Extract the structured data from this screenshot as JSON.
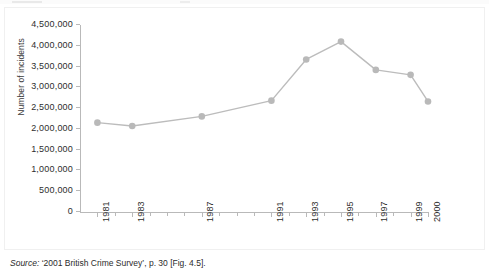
{
  "chart_data": {
    "type": "line",
    "title": "",
    "xlabel": "",
    "ylabel": "Number of incidents",
    "x": [
      1981,
      1983,
      1987,
      1991,
      1993,
      1995,
      1997,
      1999,
      2000
    ],
    "values": [
      2150000,
      2070000,
      2300000,
      2680000,
      3670000,
      4100000,
      3420000,
      3300000,
      2660000
    ],
    "series": [
      {
        "name": "Number of incidents",
        "values": [
          2150000,
          2070000,
          2300000,
          2680000,
          3670000,
          4100000,
          3420000,
          3300000,
          2660000
        ]
      }
    ],
    "categories": [
      "1981",
      "1983",
      "1987",
      "1991",
      "1993",
      "1995",
      "1997",
      "1999",
      "2000"
    ],
    "ylim": [
      0,
      4500000
    ],
    "xlim": [
      1980.5,
      2000.5
    ],
    "ytick_labels": [
      "0",
      "500,000",
      "1,000,000",
      "1,500,000",
      "2,000,000",
      "2,500,000",
      "3,000,000",
      "3,500,000",
      "4,000,000",
      "4,500,000"
    ],
    "ytick_values": [
      0,
      500000,
      1000000,
      1500000,
      2000000,
      2500000,
      3000000,
      3500000,
      4000000,
      4500000
    ],
    "xtick_years": [
      1981,
      1982,
      1983,
      1984,
      1985,
      1986,
      1987,
      1988,
      1989,
      1990,
      1991,
      1992,
      1993,
      1994,
      1995,
      1996,
      1997,
      1998,
      1999,
      2000
    ],
    "xtick_labelled": [
      "1981",
      "1983",
      "1987",
      "1991",
      "1993",
      "1995",
      "1997",
      "1999",
      "2000"
    ],
    "grid": false,
    "legend": "none",
    "line_color": "#bcbcbc",
    "marker_color": "#b9b9b9",
    "axis_color": "#b9b9b9",
    "marker": "circle"
  },
  "source": {
    "label": "Source:",
    "text": "‘2001 British Crime Survey’, p. 30 [Fig. 4.5]."
  }
}
